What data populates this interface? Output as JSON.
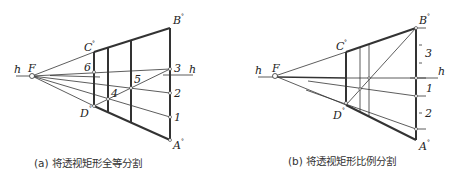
{
  "figure_a": {
    "caption": "(a) 将透视矩形全等分割",
    "labels": {
      "h_left": "h",
      "h_right": "h",
      "F": "F",
      "C": "C",
      "D": "D",
      "B": "B",
      "A": "A",
      "deg": "°",
      "p1": "1",
      "p2": "2",
      "p3": "3",
      "p4": "4",
      "p5": "5",
      "p6": "6"
    }
  },
  "figure_b": {
    "caption": "(b) 将透视矩形比例分割",
    "labels": {
      "h_left": "h",
      "h_right": "h",
      "F": "F",
      "C": "C",
      "D": "D",
      "B": "B",
      "A": "A",
      "deg": "°",
      "r3": "3",
      "r1": "1",
      "r2": "2"
    }
  },
  "colors": {
    "line": "#222222",
    "thin": "#444444",
    "caption": "#333333"
  }
}
